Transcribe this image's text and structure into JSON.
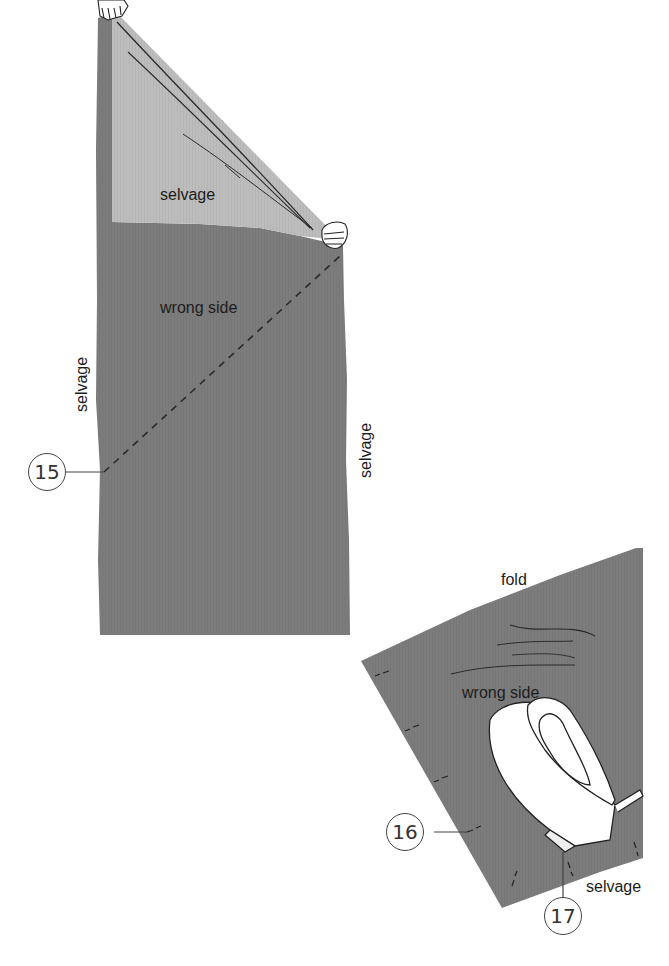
{
  "figure": {
    "colors": {
      "fabric_wrong_side": "#7c7c7c",
      "fabric_light_fold": "#bdbdbd",
      "background": "#ffffff",
      "line_ink": "#2a2a2a"
    },
    "panel_top": {
      "labels": {
        "folded_corner": "selvage",
        "body": "wrong side",
        "left_edge": "selvage",
        "right_edge": "selvage"
      },
      "callout": "15"
    },
    "panel_bottom": {
      "labels": {
        "top_edge": "fold",
        "body": "wrong side",
        "bottom_edge": "selvage"
      },
      "callouts": [
        "16",
        "17"
      ]
    }
  }
}
